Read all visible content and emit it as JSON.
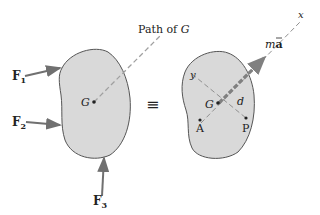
{
  "diagram": {
    "left_body": {
      "forces": [
        {
          "name": "F",
          "subscript": "1"
        },
        {
          "name": "F",
          "subscript": "2"
        },
        {
          "name": "F",
          "subscript": "3"
        }
      ],
      "center_label": "G",
      "path_label_prefix": "Path of ",
      "path_label_var": "G"
    },
    "equivalence_symbol": "≡",
    "right_body": {
      "axis_x": "x",
      "axis_y": "y",
      "center_label": "G",
      "distance_label": "d",
      "point_a": "A",
      "point_p": "P",
      "vector_label_m": "m",
      "vector_label_a": "a"
    },
    "colors": {
      "body_fill": "#d9d9d9",
      "body_stroke": "#555555",
      "arrow": "#707070",
      "dashed": "#a0a0a0"
    }
  }
}
